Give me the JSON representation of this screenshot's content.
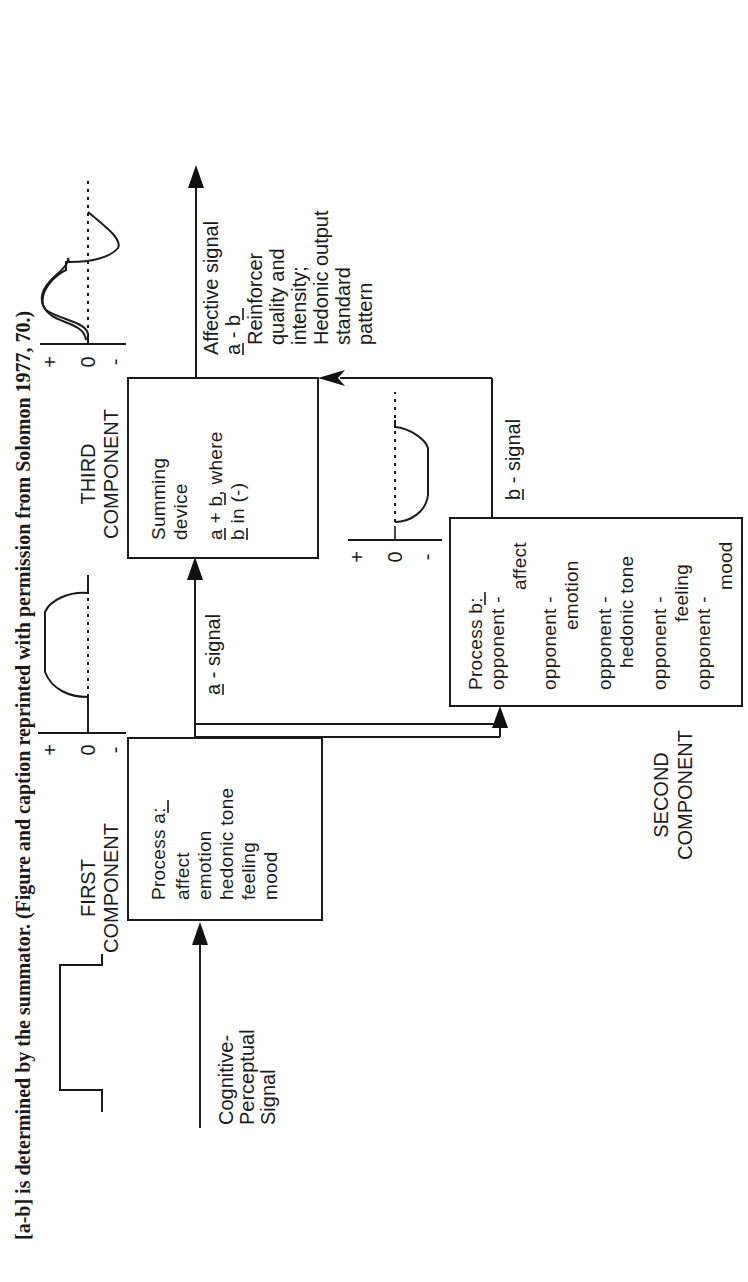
{
  "caption": "[a-b] is determined by the summator. (Figure and caption reprinted with permission from Solomon 1977, 70.)",
  "input": {
    "label_lines": [
      "Cognitive-",
      "Perceptual",
      "Signal"
    ]
  },
  "first_component": {
    "title_lines": [
      "FIRST",
      "COMPONENT"
    ],
    "box_lines": [
      "Process a:",
      "affect",
      "emotion",
      "hedonic tone",
      "feeling",
      "mood"
    ],
    "underlined": "a"
  },
  "second_component": {
    "title_lines": [
      "SECOND",
      "COMPONENT"
    ],
    "box_lines": [
      "Process b:",
      "opponent -",
      "affect",
      "opponent -",
      "emotion",
      "opponent -",
      "hedonic tone",
      "opponent -",
      "feeling",
      "opponent -",
      "mood"
    ],
    "underlined": "b"
  },
  "third_component": {
    "title_lines": [
      "THIRD",
      "COMPONENT"
    ],
    "box_lines": [
      "Summing",
      "device",
      "a + b, where",
      "b in (-)"
    ]
  },
  "signals": {
    "a_signal": "a - signal",
    "b_signal": "b - signal"
  },
  "output": {
    "label_lines": [
      "Affective signal",
      "a - b",
      "Reinforcer",
      "quality and",
      "intensity;",
      "Hedonic output",
      "standard",
      "pattern"
    ]
  },
  "axes": {
    "plus": "+",
    "zero": "0",
    "minus": "-"
  }
}
